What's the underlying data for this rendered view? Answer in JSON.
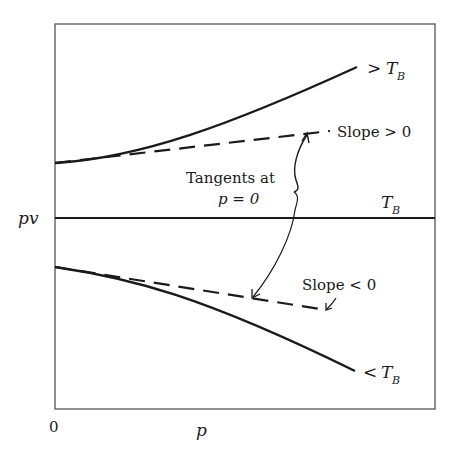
{
  "diagram": {
    "type": "pv-vs-p isotherms (Boyle temperature)",
    "axes": {
      "y_label": "pv",
      "x_label": "p",
      "origin_label": "0"
    },
    "curves": [
      {
        "name": "above-boyle",
        "label_prefix": ">",
        "label_symbol": "T",
        "label_subscript": "B",
        "style": "solid",
        "trend": "increasing"
      },
      {
        "name": "boyle",
        "label_prefix": "",
        "label_symbol": "T",
        "label_subscript": "B",
        "style": "solid",
        "trend": "flat"
      },
      {
        "name": "below-boyle",
        "label_prefix": "<",
        "label_symbol": "T",
        "label_subscript": "B",
        "style": "solid",
        "trend": "decreasing"
      }
    ],
    "tangents": [
      {
        "name": "upper-tangent",
        "label": "Slope > 0",
        "style": "dashed"
      },
      {
        "name": "lower-tangent",
        "label": "Slope < 0",
        "style": "dashed"
      }
    ],
    "annotation": {
      "line1": "Tangents at",
      "line2": "p = 0"
    },
    "colors": {
      "ink": "#1a1a1a",
      "frame": "#555555",
      "background": "#ffffff"
    }
  }
}
